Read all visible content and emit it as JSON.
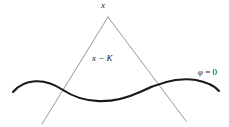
{
  "figure": {
    "type": "light-cone-diagram",
    "width": 229,
    "height": 127,
    "background_color": "#ffffff"
  },
  "labels": {
    "apex": "x",
    "region": "x − K",
    "surface_phi": "φ",
    "surface_equals": " = 0",
    "surface_full": "φ = 0"
  },
  "colors": {
    "cone_line": "#8c8c8c",
    "curve": "#1a1a1a",
    "label_text": "#1a1a1a",
    "background": "#ffffff"
  },
  "geometry": {
    "cone": {
      "apex": {
        "x": 108,
        "y": 17
      },
      "left_leg_end": {
        "x": 42,
        "y": 124
      },
      "right_leg_end": {
        "x": 186,
        "y": 121
      },
      "stroke_width": 0.9
    },
    "curve": {
      "description": "wavy spacelike surface phi = 0",
      "stroke_width": 2.1,
      "path": "M 13 92 C 24 79, 44 77, 63 90 C 84 104, 112 105, 140 92 C 158 83, 178 77, 196 80 C 206 82, 214 85, 219 91"
    },
    "intersections": [
      {
        "x": 64,
        "y": 90
      },
      {
        "x": 161,
        "y": 85
      }
    ]
  }
}
